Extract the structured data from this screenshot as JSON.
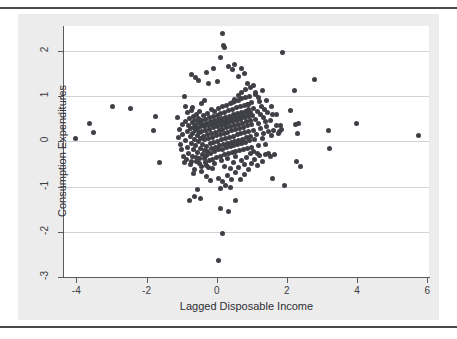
{
  "figure": {
    "background_color": "#ececed",
    "panel_color": "#ffffff",
    "rule_color": "#4a4a4a",
    "top_rule_name": "top-rule",
    "bottom_rule_name": "bottom-rule"
  },
  "chart_data": {
    "type": "scatter",
    "title": "",
    "xlabel": "Lagged Disposable Income",
    "ylabel": "Consumption Expenditures",
    "xlim": [
      -4.35,
      6.05
    ],
    "ylim": [
      -3.0,
      2.55
    ],
    "xticks": [
      -4,
      -2,
      0,
      2,
      4,
      6
    ],
    "xticklabels": [
      "-4",
      "-2",
      "0",
      "2",
      "4",
      "6"
    ],
    "yticks": [
      2,
      1,
      0,
      -1,
      -2,
      -3
    ],
    "yticklabels": [
      "2",
      "1",
      "0",
      "-1",
      "-2",
      "-3"
    ],
    "grid": "horizontal",
    "grid_color": "#d2d2d6",
    "marker": {
      "shape": "circle",
      "color": "#3f3f46",
      "size_px": 5
    },
    "legend": null,
    "n_points": 420,
    "points": [
      [
        -4.02,
        0.06
      ],
      [
        -3.62,
        0.4
      ],
      [
        -3.52,
        0.19
      ],
      [
        -2.97,
        0.77
      ],
      [
        -2.46,
        0.72
      ],
      [
        -1.74,
        0.56
      ],
      [
        -1.79,
        0.25
      ],
      [
        -1.64,
        -0.47
      ],
      [
        -1.11,
        0.53
      ],
      [
        -1.08,
        0.09
      ],
      [
        -1.05,
        0.26
      ],
      [
        -1.03,
        -0.06
      ],
      [
        -1.0,
        -0.19
      ],
      [
        -0.98,
        0.37
      ],
      [
        -0.96,
        0.16
      ],
      [
        -0.94,
        -0.33
      ],
      [
        -0.92,
        0.99
      ],
      [
        -0.9,
        0.44
      ],
      [
        -0.88,
        0.02
      ],
      [
        -0.86,
        -0.41
      ],
      [
        -0.84,
        0.63
      ],
      [
        -0.83,
        0.22
      ],
      [
        -0.82,
        -0.13
      ],
      [
        -0.8,
        0.34
      ],
      [
        -0.79,
        -0.27
      ],
      [
        -0.78,
        0.51
      ],
      [
        -0.76,
        0.1
      ],
      [
        -0.75,
        -0.52
      ],
      [
        -0.74,
        0.28
      ],
      [
        -0.72,
        0.69
      ],
      [
        -0.71,
        -0.05
      ],
      [
        -0.7,
        0.41
      ],
      [
        -0.69,
        -0.34
      ],
      [
        -0.68,
        0.17
      ],
      [
        -0.67,
        0.55
      ],
      [
        -0.66,
        -0.18
      ],
      [
        -0.65,
        0.31
      ],
      [
        -0.64,
        0.04
      ],
      [
        -0.63,
        -0.62
      ],
      [
        -0.62,
        0.47
      ],
      [
        -0.61,
        0.23
      ],
      [
        -0.77,
        -1.3
      ],
      [
        -0.69,
        0.74
      ],
      [
        -0.6,
        -0.09
      ],
      [
        -0.59,
        0.36
      ],
      [
        -0.58,
        -0.44
      ],
      [
        -0.57,
        0.6
      ],
      [
        -0.56,
        0.13
      ],
      [
        -0.55,
        -0.24
      ],
      [
        -0.54,
        0.29
      ],
      [
        -0.53,
        0.5
      ],
      [
        -0.52,
        -0.01
      ],
      [
        -0.51,
        0.42
      ],
      [
        -0.5,
        -0.37
      ],
      [
        -0.49,
        0.19
      ],
      [
        -0.48,
        0.66
      ],
      [
        -0.47,
        -0.15
      ],
      [
        -0.46,
        0.33
      ],
      [
        -0.45,
        0.07
      ],
      [
        -0.44,
        -0.55
      ],
      [
        -0.43,
        0.45
      ],
      [
        -0.42,
        0.21
      ],
      [
        -0.41,
        -0.08
      ],
      [
        -0.4,
        0.38
      ],
      [
        -0.39,
        -0.29
      ],
      [
        -0.38,
        0.57
      ],
      [
        -0.37,
        0.11
      ],
      [
        -0.36,
        -0.2
      ],
      [
        -0.35,
        0.32
      ],
      [
        -0.34,
        0.03
      ],
      [
        -0.33,
        -0.47
      ],
      [
        -0.32,
        0.49
      ],
      [
        -0.31,
        0.25
      ],
      [
        -0.3,
        -0.11
      ],
      [
        -0.29,
        0.4
      ],
      [
        -0.28,
        -0.32
      ],
      [
        -0.27,
        0.62
      ],
      [
        -0.26,
        0.15
      ],
      [
        -0.25,
        -0.22
      ],
      [
        -0.24,
        0.35
      ],
      [
        -0.23,
        0.06
      ],
      [
        -0.22,
        -0.58
      ],
      [
        -0.21,
        0.52
      ],
      [
        -0.2,
        0.27
      ],
      [
        -0.19,
        -0.04
      ],
      [
        -0.18,
        0.43
      ],
      [
        -0.17,
        -0.26
      ],
      [
        -0.16,
        0.7
      ],
      [
        -0.15,
        0.18
      ],
      [
        -0.14,
        -0.16
      ],
      [
        -0.13,
        0.37
      ],
      [
        -0.12,
        0.09
      ],
      [
        -0.11,
        -0.4
      ],
      [
        -0.1,
        0.54
      ],
      [
        -0.09,
        0.3
      ],
      [
        -0.08,
        -0.02
      ],
      [
        -0.07,
        0.46
      ],
      [
        -0.06,
        -0.23
      ],
      [
        -0.05,
        0.67
      ],
      [
        -0.04,
        0.2
      ],
      [
        -0.03,
        -0.13
      ],
      [
        -0.02,
        0.39
      ],
      [
        -0.01,
        0.12
      ],
      [
        0.0,
        -0.36
      ],
      [
        0.01,
        0.58
      ],
      [
        0.02,
        0.33
      ],
      [
        0.03,
        0.0
      ],
      [
        0.04,
        0.48
      ],
      [
        0.05,
        -0.19
      ],
      [
        0.06,
        0.72
      ],
      [
        0.07,
        0.24
      ],
      [
        0.08,
        -0.1
      ],
      [
        0.09,
        0.41
      ],
      [
        0.1,
        0.14
      ],
      [
        0.11,
        -0.33
      ],
      [
        0.12,
        0.61
      ],
      [
        0.13,
        0.36
      ],
      [
        0.14,
        0.03
      ],
      [
        0.15,
        0.51
      ],
      [
        0.16,
        -0.17
      ],
      [
        0.17,
        0.76
      ],
      [
        0.18,
        0.27
      ],
      [
        0.19,
        -0.07
      ],
      [
        0.2,
        0.44
      ],
      [
        0.21,
        0.17
      ],
      [
        0.22,
        -0.3
      ],
      [
        0.23,
        0.64
      ],
      [
        0.24,
        0.38
      ],
      [
        0.25,
        0.06
      ],
      [
        0.26,
        0.53
      ],
      [
        0.27,
        -0.14
      ],
      [
        0.28,
        0.8
      ],
      [
        0.29,
        0.3
      ],
      [
        0.3,
        -0.05
      ],
      [
        0.31,
        0.47
      ],
      [
        0.32,
        0.2
      ],
      [
        0.33,
        -0.27
      ],
      [
        0.34,
        0.68
      ],
      [
        0.35,
        0.41
      ],
      [
        0.36,
        0.09
      ],
      [
        0.37,
        0.56
      ],
      [
        0.38,
        -0.12
      ],
      [
        0.39,
        0.84
      ],
      [
        0.4,
        0.33
      ],
      [
        0.41,
        -0.03
      ],
      [
        0.42,
        0.5
      ],
      [
        0.43,
        0.23
      ],
      [
        0.44,
        -0.25
      ],
      [
        0.45,
        0.71
      ],
      [
        0.46,
        0.44
      ],
      [
        0.47,
        0.11
      ],
      [
        0.48,
        0.59
      ],
      [
        0.49,
        -0.09
      ],
      [
        0.5,
        0.88
      ],
      [
        0.51,
        0.35
      ],
      [
        0.52,
        -0.01
      ],
      [
        0.53,
        0.52
      ],
      [
        0.54,
        0.26
      ],
      [
        0.55,
        -0.22
      ],
      [
        0.56,
        0.74
      ],
      [
        0.57,
        0.46
      ],
      [
        0.58,
        0.14
      ],
      [
        0.59,
        0.62
      ],
      [
        0.6,
        -0.06
      ],
      [
        0.61,
        0.91
      ],
      [
        0.62,
        0.38
      ],
      [
        0.63,
        0.02
      ],
      [
        0.64,
        0.55
      ],
      [
        0.65,
        0.28
      ],
      [
        0.66,
        -0.2
      ],
      [
        0.67,
        0.77
      ],
      [
        0.68,
        0.49
      ],
      [
        0.69,
        0.17
      ],
      [
        0.7,
        0.64
      ],
      [
        0.71,
        -0.04
      ],
      [
        0.72,
        0.94
      ],
      [
        0.73,
        0.4
      ],
      [
        0.74,
        0.05
      ],
      [
        0.75,
        0.58
      ],
      [
        0.76,
        0.31
      ],
      [
        0.77,
        -0.18
      ],
      [
        0.78,
        0.79
      ],
      [
        0.79,
        0.52
      ],
      [
        0.8,
        0.19
      ],
      [
        0.81,
        0.67
      ],
      [
        0.82,
        -0.02
      ],
      [
        0.83,
        0.97
      ],
      [
        0.84,
        0.43
      ],
      [
        0.85,
        0.08
      ],
      [
        0.86,
        0.61
      ],
      [
        0.87,
        0.34
      ],
      [
        0.88,
        -0.15
      ],
      [
        0.89,
        0.82
      ],
      [
        0.9,
        0.54
      ],
      [
        0.91,
        0.22
      ],
      [
        0.92,
        0.7
      ],
      [
        0.93,
        0.01
      ],
      [
        0.94,
        1.0
      ],
      [
        0.95,
        0.46
      ],
      [
        0.96,
        0.11
      ],
      [
        0.97,
        0.64
      ],
      [
        0.98,
        0.37
      ],
      [
        0.99,
        -0.13
      ],
      [
        1.0,
        0.85
      ],
      [
        1.02,
        0.57
      ],
      [
        1.04,
        0.25
      ],
      [
        1.06,
        0.73
      ],
      [
        1.08,
        0.04
      ],
      [
        1.1,
        1.03
      ],
      [
        1.12,
        0.49
      ],
      [
        1.14,
        0.14
      ],
      [
        1.16,
        0.67
      ],
      [
        1.18,
        0.4
      ],
      [
        1.2,
        -0.1
      ],
      [
        1.22,
        0.88
      ],
      [
        1.24,
        0.6
      ],
      [
        1.26,
        0.28
      ],
      [
        1.28,
        0.76
      ],
      [
        1.3,
        0.07
      ],
      [
        1.32,
        0.52
      ],
      [
        1.34,
        0.18
      ],
      [
        1.36,
        0.7
      ],
      [
        1.38,
        0.43
      ],
      [
        1.4,
        -0.07
      ],
      [
        1.42,
        0.33
      ],
      [
        1.45,
        0.63
      ],
      [
        1.48,
        0.21
      ],
      [
        1.52,
        0.46
      ],
      [
        1.55,
        0.12
      ],
      [
        1.58,
        0.6
      ],
      [
        1.62,
        0.25
      ],
      [
        1.65,
        -0.29
      ],
      [
        1.7,
        0.35
      ],
      [
        1.75,
        0.18
      ],
      [
        1.8,
        0.22
      ],
      [
        1.85,
        0.27
      ],
      [
        0.15,
        -0.43
      ],
      [
        0.22,
        -0.55
      ],
      [
        0.31,
        -0.38
      ],
      [
        0.4,
        -0.61
      ],
      [
        0.48,
        -0.46
      ],
      [
        0.55,
        -0.33
      ],
      [
        0.62,
        -0.58
      ],
      [
        0.7,
        -0.42
      ],
      [
        0.78,
        -0.51
      ],
      [
        0.85,
        -0.36
      ],
      [
        0.92,
        -0.63
      ],
      [
        1.0,
        -0.48
      ],
      [
        1.08,
        -0.4
      ],
      [
        1.15,
        -0.54
      ],
      [
        1.22,
        -0.31
      ],
      [
        1.3,
        -0.45
      ],
      [
        -0.05,
        -0.48
      ],
      [
        -0.12,
        -0.6
      ],
      [
        -0.2,
        -0.42
      ],
      [
        -0.28,
        -0.54
      ],
      [
        -0.35,
        -0.38
      ],
      [
        -0.43,
        -0.66
      ],
      [
        -0.5,
        -0.5
      ],
      [
        -0.58,
        -0.35
      ],
      [
        -0.65,
        -0.71
      ],
      [
        -0.72,
        -0.44
      ],
      [
        -0.3,
        -0.78
      ],
      [
        -0.18,
        -0.86
      ],
      [
        0.05,
        -0.82
      ],
      [
        0.18,
        -0.88
      ],
      [
        0.3,
        -0.76
      ],
      [
        0.42,
        -0.84
      ],
      [
        0.55,
        -0.7
      ],
      [
        0.68,
        -0.85
      ],
      [
        0.8,
        -0.74
      ],
      [
        0.25,
        -0.97
      ],
      [
        0.1,
        -1.05
      ],
      [
        0.38,
        -1.01
      ],
      [
        -0.55,
        -1.07
      ],
      [
        -0.62,
        -1.23
      ],
      [
        -0.45,
        -1.26
      ],
      [
        0.12,
        -1.48
      ],
      [
        0.35,
        -1.56
      ],
      [
        0.55,
        -1.31
      ],
      [
        0.18,
        -2.04
      ],
      [
        0.05,
        -2.64
      ],
      [
        -0.72,
        1.47
      ],
      [
        -0.6,
        1.42
      ],
      [
        -0.52,
        1.35
      ],
      [
        -0.3,
        1.52
      ],
      [
        -0.22,
        1.28
      ],
      [
        -0.08,
        1.6
      ],
      [
        0.02,
        1.33
      ],
      [
        0.12,
        1.86
      ],
      [
        0.2,
        2.12
      ],
      [
        0.22,
        2.08
      ],
      [
        0.18,
        2.38
      ],
      [
        0.33,
        1.66
      ],
      [
        0.45,
        1.58
      ],
      [
        0.52,
        1.7
      ],
      [
        0.62,
        1.44
      ],
      [
        0.7,
        1.62
      ],
      [
        0.8,
        1.5
      ],
      [
        0.88,
        1.28
      ],
      [
        0.95,
        1.18
      ],
      [
        1.05,
        1.24
      ],
      [
        1.12,
        1.08
      ],
      [
        1.2,
        0.96
      ],
      [
        1.3,
        1.12
      ],
      [
        1.42,
        0.9
      ],
      [
        1.55,
        0.78
      ],
      [
        1.7,
        0.6
      ],
      [
        1.82,
        0.36
      ],
      [
        1.88,
        1.97
      ],
      [
        1.92,
        -0.98
      ],
      [
        1.6,
        -0.82
      ],
      [
        2.1,
        0.68
      ],
      [
        2.22,
        1.12
      ],
      [
        2.25,
        0.38
      ],
      [
        2.3,
        0.17
      ],
      [
        2.32,
        0.39
      ],
      [
        2.28,
        -0.44
      ],
      [
        2.38,
        -0.55
      ],
      [
        2.8,
        1.37
      ],
      [
        3.2,
        0.25
      ],
      [
        3.22,
        -0.15
      ],
      [
        3.98,
        0.39
      ],
      [
        5.75,
        0.13
      ],
      [
        -0.88,
        0.78
      ],
      [
        -0.92,
        -0.46
      ],
      [
        1.48,
        -0.28
      ],
      [
        1.52,
        -0.34
      ],
      [
        1.38,
        -0.3
      ],
      [
        0.95,
        -0.26
      ],
      [
        1.05,
        -0.22
      ],
      [
        1.15,
        -0.26
      ],
      [
        -0.42,
        0.84
      ],
      [
        -0.36,
        0.9
      ],
      [
        0.62,
        1.02
      ],
      [
        0.72,
        1.08
      ],
      [
        0.82,
        1.14
      ],
      [
        0.9,
        0.82
      ],
      [
        0.52,
        0.92
      ],
      [
        0.44,
        0.86
      ]
    ]
  }
}
